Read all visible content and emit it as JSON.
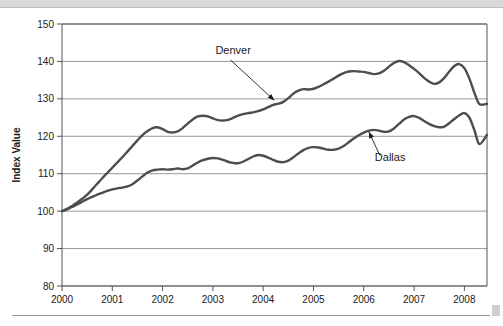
{
  "figure": {
    "background_color": "#ffffff",
    "top_band_color": "#d9d9d9",
    "rule_color": "#9a9a9a"
  },
  "chart_data": {
    "type": "line",
    "title": "",
    "subtitle": "",
    "xlabel": "",
    "ylabel": "Index Value",
    "xlim": [
      2000,
      2008.45
    ],
    "ylim": [
      80,
      150
    ],
    "ytick_step": 10,
    "grid": true,
    "grid_axis": "y",
    "legend_position": "annotations-on-plot",
    "x_tick_labels": [
      "2000",
      "2001",
      "2002",
      "2003",
      "2004",
      "2005",
      "2006",
      "2007",
      "2008"
    ],
    "x_ticks": [
      2000,
      2001,
      2002,
      2003,
      2004,
      2005,
      2006,
      2007,
      2008
    ],
    "y_tick_labels": [
      "80",
      "90",
      "100",
      "110",
      "120",
      "130",
      "140",
      "150"
    ],
    "y_ticks": [
      80,
      90,
      100,
      110,
      120,
      130,
      140,
      150
    ],
    "line_color": "#4d4d4d",
    "line_width": 2.4,
    "annotations": [
      {
        "label": "Denver",
        "text_x": 2003.05,
        "text_y": 141.9,
        "arrow_from_x": 2003.35,
        "arrow_from_y": 140.4,
        "arrow_to_x": 2004.22,
        "arrow_to_y": 129.6
      },
      {
        "label": "Dallas",
        "text_x": 2006.22,
        "text_y": 113.4,
        "arrow_from_x": 2006.32,
        "arrow_from_y": 114.9,
        "arrow_to_x": 2006.1,
        "arrow_to_y": 121.2
      }
    ],
    "series": [
      {
        "name": "Denver",
        "x": [
          2000.0,
          2000.1,
          2000.2,
          2000.3,
          2000.4,
          2000.5,
          2000.6,
          2000.7,
          2000.8,
          2000.9,
          2001.0,
          2001.1,
          2001.2,
          2001.3,
          2001.4,
          2001.5,
          2001.6,
          2001.7,
          2001.8,
          2001.9,
          2002.0,
          2002.1,
          2002.2,
          2002.3,
          2002.4,
          2002.5,
          2002.6,
          2002.7,
          2002.8,
          2002.9,
          2003.0,
          2003.1,
          2003.2,
          2003.3,
          2003.4,
          2003.5,
          2003.6,
          2003.7,
          2003.8,
          2003.9,
          2004.0,
          2004.1,
          2004.2,
          2004.3,
          2004.4,
          2004.5,
          2004.6,
          2004.7,
          2004.8,
          2004.9,
          2005.0,
          2005.1,
          2005.2,
          2005.3,
          2005.4,
          2005.5,
          2005.6,
          2005.7,
          2005.8,
          2005.9,
          2006.0,
          2006.1,
          2006.2,
          2006.3,
          2006.4,
          2006.5,
          2006.6,
          2006.7,
          2006.8,
          2006.9,
          2007.0,
          2007.1,
          2007.2,
          2007.3,
          2007.4,
          2007.5,
          2007.6,
          2007.7,
          2007.8,
          2007.9,
          2008.0,
          2008.1,
          2008.2,
          2008.3,
          2008.45
        ],
        "y": [
          100.0,
          100.6,
          101.4,
          102.3,
          103.3,
          104.4,
          105.8,
          107.3,
          108.8,
          110.2,
          111.6,
          113.0,
          114.4,
          115.9,
          117.4,
          118.9,
          120.3,
          121.4,
          122.2,
          122.4,
          121.9,
          121.2,
          121.0,
          121.3,
          122.2,
          123.4,
          124.5,
          125.3,
          125.5,
          125.3,
          124.8,
          124.3,
          124.2,
          124.4,
          124.9,
          125.5,
          125.9,
          126.2,
          126.4,
          126.7,
          127.2,
          127.8,
          128.4,
          128.7,
          129.2,
          130.2,
          131.4,
          132.2,
          132.6,
          132.5,
          132.7,
          133.2,
          133.9,
          134.6,
          135.4,
          136.2,
          136.9,
          137.3,
          137.4,
          137.3,
          137.2,
          136.9,
          136.6,
          136.8,
          137.5,
          138.6,
          139.6,
          140.1,
          139.8,
          139.0,
          138.0,
          136.9,
          135.6,
          134.6,
          134.0,
          134.4,
          135.6,
          137.3,
          138.8,
          139.3,
          138.2,
          135.4,
          131.6,
          128.6,
          128.7
        ]
      },
      {
        "name": "Dallas",
        "x": [
          2000.0,
          2000.1,
          2000.2,
          2000.3,
          2000.4,
          2000.5,
          2000.6,
          2000.7,
          2000.8,
          2000.9,
          2001.0,
          2001.1,
          2001.2,
          2001.3,
          2001.4,
          2001.5,
          2001.6,
          2001.7,
          2001.8,
          2001.9,
          2002.0,
          2002.1,
          2002.2,
          2002.3,
          2002.4,
          2002.5,
          2002.6,
          2002.7,
          2002.8,
          2002.9,
          2003.0,
          2003.1,
          2003.2,
          2003.3,
          2003.4,
          2003.5,
          2003.6,
          2003.7,
          2003.8,
          2003.9,
          2004.0,
          2004.1,
          2004.2,
          2004.3,
          2004.4,
          2004.5,
          2004.6,
          2004.7,
          2004.8,
          2004.9,
          2005.0,
          2005.1,
          2005.2,
          2005.3,
          2005.4,
          2005.5,
          2005.6,
          2005.7,
          2005.8,
          2005.9,
          2006.0,
          2006.1,
          2006.2,
          2006.3,
          2006.4,
          2006.5,
          2006.6,
          2006.7,
          2006.8,
          2006.9,
          2007.0,
          2007.1,
          2007.2,
          2007.3,
          2007.4,
          2007.5,
          2007.6,
          2007.7,
          2007.8,
          2007.9,
          2008.0,
          2008.1,
          2008.2,
          2008.3,
          2008.45
        ],
        "y": [
          100.0,
          100.5,
          101.1,
          101.8,
          102.5,
          103.2,
          103.8,
          104.4,
          104.9,
          105.4,
          105.8,
          106.1,
          106.3,
          106.6,
          107.2,
          108.2,
          109.3,
          110.3,
          110.9,
          111.1,
          111.2,
          111.1,
          111.2,
          111.4,
          111.2,
          111.4,
          112.2,
          113.0,
          113.6,
          114.0,
          114.2,
          114.1,
          113.7,
          113.2,
          112.9,
          112.8,
          113.2,
          113.9,
          114.6,
          115.0,
          114.8,
          114.3,
          113.7,
          113.2,
          113.1,
          113.5,
          114.4,
          115.4,
          116.3,
          116.9,
          117.1,
          117.0,
          116.7,
          116.4,
          116.4,
          116.7,
          117.4,
          118.4,
          119.4,
          120.3,
          121.0,
          121.5,
          121.7,
          121.5,
          121.2,
          121.3,
          122.1,
          123.3,
          124.5,
          125.2,
          125.4,
          124.9,
          124.1,
          123.3,
          122.7,
          122.4,
          122.6,
          123.5,
          124.6,
          125.6,
          126.2,
          125.0,
          121.6,
          117.9,
          120.4
        ]
      }
    ]
  }
}
